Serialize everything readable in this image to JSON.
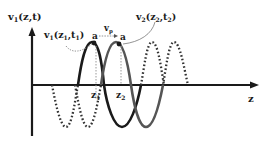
{
  "diagram": {
    "y_axis_label": "v",
    "y_axis_sub": "1",
    "y_axis_args": "(z,t)",
    "x_axis_label": "z",
    "wave1_label": {
      "v": "v",
      "sub": "1",
      "args_open": "(z",
      "z_sub": "1",
      "mid": ",t",
      "t_sub": "1",
      "close": ")"
    },
    "wave2_label": {
      "v": "v",
      "sub": "2",
      "args_open": "(z",
      "z_sub": "2",
      "mid": ",t",
      "t_sub": "2",
      "close": ")"
    },
    "velocity_label": {
      "v": "v",
      "sub": "p"
    },
    "point_label_1": "a",
    "point_label_2": "a",
    "z1_label": {
      "z": "z",
      "sub": "1"
    },
    "z2_label": {
      "z": "z",
      "sub": "2"
    },
    "colors": {
      "ink": "#1a1a1a",
      "dotted": "#333333",
      "guide": "#999999"
    }
  }
}
